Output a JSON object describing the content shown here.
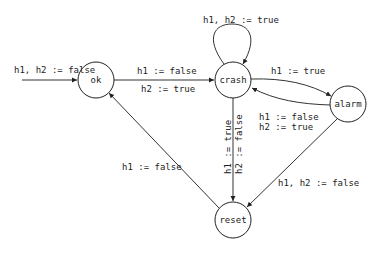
{
  "diagram": {
    "type": "state-machine",
    "nodes": [
      {
        "id": "ok",
        "label": "ok"
      },
      {
        "id": "crash",
        "label": "crash"
      },
      {
        "id": "alarm",
        "label": "alarm"
      },
      {
        "id": "reset",
        "label": "reset"
      }
    ],
    "edges": [
      {
        "id": "init",
        "from": null,
        "to": "ok",
        "label": "h1, h2 := false"
      },
      {
        "id": "ok-crash",
        "from": "ok",
        "to": "crash",
        "label_top": "h1 := false",
        "label_bottom": "h2 := true"
      },
      {
        "id": "crash-self",
        "from": "crash",
        "to": "crash",
        "label": "h1, h2 := true"
      },
      {
        "id": "crash-alarm",
        "from": "crash",
        "to": "alarm",
        "label": "h1 := true"
      },
      {
        "id": "alarm-crash",
        "from": "alarm",
        "to": "crash",
        "label_line1": "h1 := false",
        "label_line2": "h2 := true"
      },
      {
        "id": "crash-reset",
        "from": "crash",
        "to": "reset",
        "label_line1": "h1 := true",
        "label_line2": "h2 := false"
      },
      {
        "id": "alarm-reset",
        "from": "alarm",
        "to": "reset",
        "label": "h1, h2 := false"
      },
      {
        "id": "reset-ok",
        "from": "reset",
        "to": "ok",
        "label": "h1 := false"
      }
    ]
  }
}
